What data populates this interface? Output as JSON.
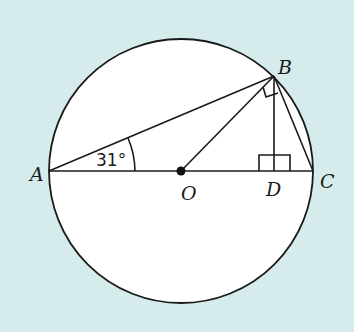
{
  "diagram": {
    "type": "circle-geometry",
    "background_color": "#d6ecec",
    "circle": {
      "center": "O",
      "cx": 181,
      "cy": 171,
      "r": 132,
      "fill": "#ffffff"
    },
    "points": {
      "A": {
        "label": "A",
        "x": 49,
        "y": 171
      },
      "B": {
        "label": "B",
        "x": 274,
        "y": 76
      },
      "C": {
        "label": "C",
        "x": 313,
        "y": 171
      },
      "O": {
        "label": "O",
        "x": 181,
        "y": 171
      },
      "D": {
        "label": "D",
        "x": 274,
        "y": 171
      }
    },
    "segments": [
      "AC",
      "AB",
      "BC",
      "OB",
      "BD"
    ],
    "right_angles": [
      "ODB / BDC at D",
      "OBC at B"
    ],
    "angle": {
      "vertex": "A",
      "label": "31°",
      "value_degrees": 31
    }
  }
}
